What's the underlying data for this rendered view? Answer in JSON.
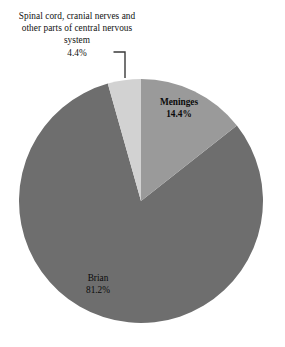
{
  "chart_data": {
    "type": "pie",
    "title": "",
    "subtitle": "",
    "xlabel": "",
    "ylabel": "",
    "legend_position": "none",
    "grid": false,
    "categories": [
      "Brian",
      "Meninges",
      "Spinal cord, cranial nerves and other parts of central nervous system"
    ],
    "values": [
      81.2,
      14.4,
      4.4
    ],
    "value_labels": [
      "81.2%",
      "14.4%",
      "4.4%"
    ],
    "units": "percent",
    "slices": [
      {
        "name": "Brian",
        "value": 81.2,
        "value_label": "81.2%",
        "color": "#6e6e6e",
        "label_placement": "inside",
        "start_angle_deg": 51.8,
        "end_angle_deg": 344.2
      },
      {
        "name": "Meninges",
        "value": 14.4,
        "value_label": "14.4%",
        "color": "#9a9a9a",
        "label_placement": "inside",
        "start_angle_deg": 0,
        "end_angle_deg": 51.8
      },
      {
        "name": "Spinal cord, cranial nerves and other parts of central nervous system",
        "value": 4.4,
        "value_label": "4.4%",
        "color": "#d2d2d2",
        "label_placement": "outside-callout",
        "start_angle_deg": 344.2,
        "end_angle_deg": 360
      }
    ]
  },
  "labels": {
    "callout": {
      "line1": "Spinal cord, cranial",
      "line2": "nerves and other parts",
      "line3": "of central nervous",
      "line4": "system",
      "percent": "4.4%"
    },
    "meninges": {
      "name": "Meninges",
      "percent": "14.4%"
    },
    "brain": {
      "name": "Brian",
      "percent": "81.2%"
    }
  },
  "colors": {
    "background": "#ffffff",
    "text": "#000000",
    "brain_slice": "#6e6e6e",
    "meninges_slice": "#9a9a9a",
    "spinal_slice": "#d2d2d2",
    "leader_line": "#3a3a3a"
  }
}
